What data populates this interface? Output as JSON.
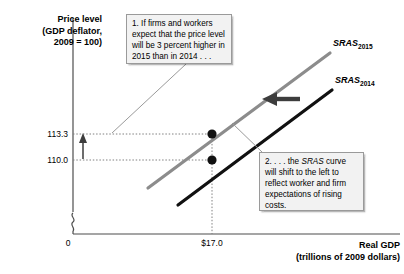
{
  "figure": {
    "background": "#ffffff",
    "axes": {
      "y_title": "Price level\n(GDP deflator,\n2009 = 100)",
      "x_title": "Real GDP\n(trillions of 2009 dollars)",
      "origin_label": "0",
      "y_ticks": [
        "113.3",
        "110.0"
      ],
      "x_ticks": [
        "$17.0"
      ]
    },
    "curves": [
      {
        "name": "sras-2015",
        "label_base": "SRAS",
        "label_sub": "2015",
        "color": "#8c8c8c",
        "year": "2015"
      },
      {
        "name": "sras-2014",
        "label_base": "SRAS",
        "label_sub": "2014",
        "color": "#000000",
        "year": "2014"
      }
    ],
    "callouts": [
      {
        "name": "callout-1",
        "number": "1.",
        "text": "1. If firms and workers expect that the price level will be 3 percent higher in 2015 than in 2014 . . ."
      },
      {
        "name": "callout-2",
        "number": "2.",
        "text": "2. . . . the SRAS curve will shift to the left to reflect worker and firm expectations of rising costs.",
        "italic_term": "SRAS"
      }
    ],
    "annotations": {
      "shift_arrow_direction": "left",
      "price_arrow_direction": "up"
    }
  },
  "chart_data": {
    "type": "line",
    "title": "",
    "xlabel": "Real GDP (trillions of 2009 dollars)",
    "ylabel": "Price level (GDP deflator, 2009 = 100)",
    "xlim": [
      0,
      20
    ],
    "ylim": [
      100,
      125
    ],
    "grid": false,
    "legend": "inline-curve-labels",
    "x_tick_values": [
      17.0
    ],
    "x_tick_labels": [
      "$17.0"
    ],
    "y_tick_values": [
      110.0,
      113.3
    ],
    "y_tick_labels": [
      "110.0",
      "113.3"
    ],
    "series": [
      {
        "name": "SRAS2014",
        "color": "#000000",
        "x": [
          13.8,
          20.2
        ],
        "y": [
          103.0,
          119.5
        ],
        "equilibrium_point": {
          "x": 17.0,
          "y": 110.0
        }
      },
      {
        "name": "SRAS2015",
        "color": "#8c8c8c",
        "x": [
          12.2,
          19.0
        ],
        "y": [
          104.0,
          121.5
        ],
        "equilibrium_point": {
          "x": 17.0,
          "y": 113.3
        }
      }
    ],
    "annotations": [
      {
        "type": "arrow",
        "direction": "left",
        "meaning": "SRAS shifts left"
      },
      {
        "type": "arrow",
        "direction": "up",
        "meaning": "price level rises from 110.0 to 113.3"
      },
      {
        "type": "point",
        "x": 17.0,
        "y": 110.0
      },
      {
        "type": "point",
        "x": 17.0,
        "y": 113.3
      }
    ]
  }
}
